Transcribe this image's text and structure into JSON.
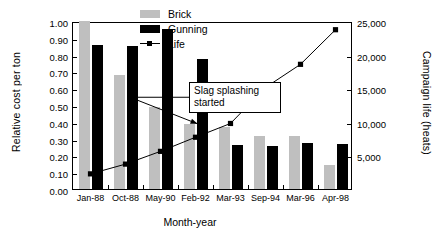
{
  "chart_data": {
    "type": "bar",
    "title": "",
    "subtitle": "",
    "xlabel": "Month-year",
    "ylabel": "Relative cost per ton",
    "y2label": "Campaign life (heats)",
    "categories": [
      "Jan-88",
      "Oct-88",
      "May-90",
      "Feb-92",
      "Mar-93",
      "Sep-94",
      "Mar-96",
      "Apr-98"
    ],
    "ylim": [
      0.0,
      1.0
    ],
    "ytick_step": 0.1,
    "ytick_labels": [
      "0.00",
      "0.10",
      "0.20",
      "0.30",
      "0.40",
      "0.50",
      "0.60",
      "0.70",
      "0.80",
      "0.90",
      "1.00"
    ],
    "ytick_values": [
      0.0,
      0.1,
      0.2,
      0.3,
      0.4,
      0.5,
      0.6,
      0.7,
      0.8,
      0.9,
      1.0
    ],
    "y2lim": [
      0,
      25000
    ],
    "y2tick_step": 5000,
    "y2tick_labels": [
      "0",
      "5,000",
      "10,000",
      "15,000",
      "20,000",
      "25,000"
    ],
    "y2tick_values": [
      0,
      5000,
      10000,
      15000,
      20000,
      25000
    ],
    "grid": false,
    "legend_position": "top-right-inside",
    "series": [
      {
        "name": "Brick",
        "type": "bar",
        "axis": "left",
        "color": "#bfbfbf",
        "values": [
          1.0,
          0.68,
          0.49,
          0.385,
          0.37,
          0.313,
          0.317,
          0.142
        ]
      },
      {
        "name": "Gunning",
        "type": "bar",
        "axis": "left",
        "color": "#000000",
        "values": [
          0.855,
          0.853,
          0.955,
          0.772,
          0.26,
          0.256,
          0.275,
          0.27
        ]
      },
      {
        "name": "Life",
        "type": "line",
        "axis": "right",
        "color": "#000000",
        "marker": "square",
        "values": [
          2550,
          4000,
          5900,
          8000,
          10050,
          15400,
          18850,
          24000
        ],
        "values_left_axis_equivalent": [
          0.102,
          0.16,
          0.236,
          0.32,
          0.402,
          0.616,
          0.754,
          0.96
        ]
      }
    ],
    "annotations": [
      {
        "text": "Slag splashing started",
        "text_lines": [
          "Slag splashing",
          "started"
        ],
        "points_to_category": "Feb-92",
        "boxed": true,
        "leader": "elbow-with-arrow"
      }
    ]
  },
  "legend": {
    "entries": [
      {
        "label": "Brick",
        "swatch": "brick-swatch"
      },
      {
        "label": "Gunning",
        "swatch": "gunning-swatch"
      },
      {
        "label": "Life",
        "swatch": "life-line-marker"
      }
    ]
  }
}
